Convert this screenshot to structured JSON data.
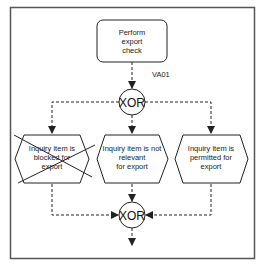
{
  "diagram": {
    "type": "EPC process flow",
    "function": {
      "label_lines": [
        "Perform",
        "export",
        "check"
      ],
      "transaction": "VA01"
    },
    "split_connector": {
      "label": "XOR"
    },
    "join_connector": {
      "label": "XOR"
    },
    "events": [
      {
        "label_lines": [
          "Inquiry item is",
          "blocked for",
          "export"
        ],
        "crossed_out": true
      },
      {
        "label_lines": [
          "Inquiry item is not",
          "relevant",
          "for export"
        ],
        "crossed_out": false
      },
      {
        "label_lines": [
          "Inquiry item is",
          "permitted for",
          "export"
        ],
        "crossed_out": false
      }
    ],
    "colors": {
      "stroke": "#222222",
      "frame": "#555555",
      "background": "#ffffff"
    }
  }
}
